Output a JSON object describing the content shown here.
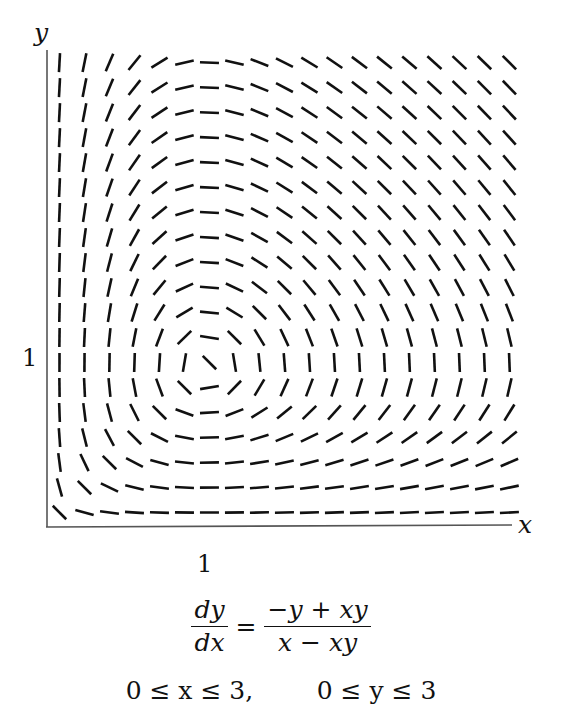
{
  "figure": {
    "y_axis_label": "y",
    "x_axis_label": "x",
    "y_tick_label": "1",
    "x_tick_label": "1",
    "equation": {
      "lhs_numerator": "dy",
      "lhs_denominator": "dx",
      "equals": "=",
      "rhs_numerator": "−y + xy",
      "rhs_denominator": "x − xy"
    },
    "domain_text": {
      "x_range": "0 ≤ x ≤ 3,",
      "y_range": "0 ≤ y ≤ 3"
    },
    "colors": {
      "ink": "#111111",
      "axis": "#555555",
      "background": "#ffffff"
    }
  },
  "chart_data": {
    "type": "slope_field",
    "title": "",
    "equation": "dy/dx = (-y + xy) / (x - xy)",
    "xlabel": "x",
    "ylabel": "y",
    "xlim": [
      0,
      3
    ],
    "ylim": [
      0,
      3
    ],
    "x_ticks": [
      1
    ],
    "y_ticks": [
      1
    ],
    "grid": false,
    "legend": null,
    "grid_size": [
      19,
      19
    ],
    "x": [
      0.0789,
      0.2368,
      0.3947,
      0.5526,
      0.7105,
      0.8684,
      1.0263,
      1.1842,
      1.3421,
      1.5,
      1.6579,
      1.8158,
      1.9737,
      2.1316,
      2.2895,
      2.4474,
      2.6053,
      2.7632,
      2.9211
    ],
    "y": [
      0.0789,
      0.2368,
      0.3947,
      0.5526,
      0.7105,
      0.8684,
      1.0263,
      1.1842,
      1.3421,
      1.5,
      1.6579,
      1.8158,
      1.9737,
      2.1316,
      2.2895,
      2.4474,
      2.6053,
      2.7632,
      2.9211
    ],
    "slopes_note": "slopes[j][i] = dy/dx at (x[i], y[j]); row 0 is the bottom row",
    "slopes": [
      [
        -1.0,
        -0.276,
        -0.131,
        -0.0694,
        -0.0349,
        -0.013,
        0.0022,
        0.0133,
        0.0218,
        0.0286,
        0.034,
        0.0385,
        0.0423,
        0.0455,
        0.0483,
        0.0507,
        0.0528,
        0.0547,
        0.0564
      ],
      [
        -3.621,
        -1.0,
        -0.476,
        -0.251,
        -0.126,
        -0.047,
        0.00796,
        0.0483,
        0.0791,
        0.103,
        0.123,
        0.139,
        0.153,
        0.165,
        0.175,
        0.184,
        0.191,
        0.198,
        0.204
      ],
      [
        -7.611,
        -2.101,
        -1.0,
        -0.528,
        -0.266,
        -0.0988,
        0.0167,
        0.101,
        0.166,
        0.217,
        0.259,
        0.293,
        0.322,
        0.346,
        0.367,
        0.386,
        0.402,
        0.416,
        0.429
      ],
      [
        -14.41,
        -3.979,
        -1.893,
        -1.0,
        -0.503,
        -0.187,
        0.0317,
        0.192,
        0.315,
        0.412,
        0.49,
        0.555,
        0.609,
        0.656,
        0.696,
        0.73,
        0.761,
        0.788,
        0.812
      ],
      [
        -28.65,
        -7.91,
        -3.763,
        -1.987,
        -1.0,
        -0.372,
        0.0629,
        0.382,
        0.626,
        0.818,
        0.974,
        1.103,
        1.211,
        1.303,
        1.383,
        1.452,
        1.513,
        1.567,
        1.615
      ],
      [
        -77.02,
        -21.27,
        -10.12,
        -5.343,
        -2.689,
        -1.0,
        0.169,
        1.027,
        1.682,
        2.2,
        2.619,
        2.965,
        3.256,
        3.504,
        3.717,
        3.903,
        4.067,
        4.211,
        4.341
      ],
      [
        455.1,
        125.7,
        59.79,
        31.57,
        15.89,
        5.909,
        -1.0,
        -6.068,
        -9.941,
        -13.0,
        -15.48,
        -17.52,
        -19.24,
        -20.71,
        -21.96,
        -23.06,
        -24.03,
        -24.89,
        -25.65
      ],
      [
        75.03,
        20.71,
        9.856,
        5.204,
        2.619,
        0.974,
        -0.165,
        -1.0,
        -1.639,
        -2.143,
        -2.551,
        -2.889,
        -3.171,
        -3.413,
        -3.621,
        -3.802,
        -3.962,
        -4.102,
        -4.228
      ],
      [
        45.78,
        12.64,
        6.014,
        3.176,
        1.598,
        0.594,
        -0.101,
        -0.61,
        -1.0,
        -1.308,
        -1.557,
        -1.763,
        -1.935,
        -2.083,
        -2.209,
        -2.32,
        -2.417,
        -2.503,
        -2.58
      ],
      [
        35.01,
        9.666,
        4.599,
        2.429,
        1.222,
        0.455,
        -0.0769,
        -0.467,
        -0.765,
        -1.0,
        -1.19,
        -1.348,
        -1.48,
        -1.593,
        -1.69,
        -1.774,
        -1.849,
        -1.914,
        -1.973
      ],
      [
        29.41,
        8.119,
        3.863,
        2.04,
        1.027,
        0.382,
        -0.0646,
        -0.392,
        -0.642,
        -0.84,
        -1.0,
        -1.132,
        -1.243,
        -1.338,
        -1.419,
        -1.49,
        -1.553,
        -1.608,
        -1.657
      ],
      [
        25.98,
        7.172,
        3.412,
        1.802,
        0.907,
        0.337,
        -0.0571,
        -0.346,
        -0.567,
        -0.742,
        -0.883,
        -1.0,
        -1.098,
        -1.182,
        -1.254,
        -1.316,
        -1.372,
        -1.42,
        -1.464
      ],
      [
        23.66,
        6.531,
        3.107,
        1.641,
        0.826,
        0.307,
        -0.052,
        -0.315,
        -0.517,
        -0.676,
        -0.804,
        -0.911,
        -1.0,
        -1.076,
        -1.142,
        -1.199,
        -1.249,
        -1.293,
        -1.333
      ],
      [
        21.99,
        6.07,
        2.888,
        1.525,
        0.768,
        0.285,
        -0.0483,
        -0.293,
        -0.48,
        -0.628,
        -0.748,
        -0.846,
        -0.929,
        -1.0,
        -1.061,
        -1.114,
        -1.161,
        -1.202,
        -1.239
      ],
      [
        20.73,
        5.722,
        2.723,
        1.438,
        0.724,
        0.269,
        -0.0455,
        -0.276,
        -0.453,
        -0.592,
        -0.705,
        -0.798,
        -0.876,
        -0.943,
        -1.0,
        -1.05,
        -1.094,
        -1.133,
        -1.168
      ],
      [
        19.73,
        5.449,
        2.592,
        1.369,
        0.689,
        0.256,
        -0.0434,
        -0.263,
        -0.431,
        -0.564,
        -0.671,
        -0.76,
        -0.834,
        -0.898,
        -0.952,
        -1.0,
        -1.042,
        -1.079,
        -1.112
      ],
      [
        18.94,
        5.229,
        2.488,
        1.314,
        0.661,
        0.246,
        -0.0416,
        -0.253,
        -0.414,
        -0.541,
        -0.644,
        -0.729,
        -0.801,
        -0.862,
        -0.914,
        -0.96,
        -1.0,
        -1.036,
        -1.067
      ],
      [
        18.29,
        5.049,
        2.402,
        1.268,
        0.638,
        0.237,
        -0.0402,
        -0.244,
        -0.399,
        -0.522,
        -0.622,
        -0.704,
        -0.773,
        -0.832,
        -0.883,
        -0.927,
        -0.966,
        -1.0,
        -1.031
      ],
      [
        17.75,
        4.901,
        2.332,
        1.231,
        0.62,
        0.23,
        -0.039,
        -0.237,
        -0.388,
        -0.507,
        -0.604,
        -0.683,
        -0.75,
        -0.807,
        -0.857,
        -0.9,
        -0.937,
        -0.971,
        -1.0
      ]
    ],
    "equilibrium_points": [
      [
        0,
        0
      ],
      [
        1,
        1
      ]
    ],
    "annotations": [
      "dy/dx = (−y + xy)/(x − xy)",
      "0 ≤ x ≤ 3, 0 ≤ y ≤ 3"
    ]
  }
}
